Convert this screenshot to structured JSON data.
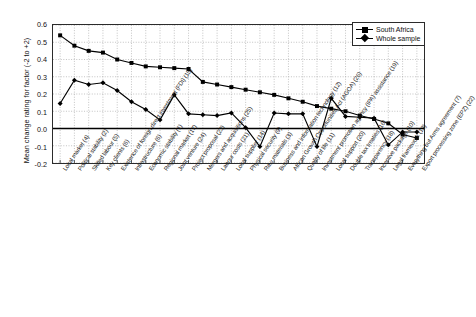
{
  "axes": {
    "ylabel": "Mean change rating for factor (-2 to +2)",
    "yticks": [
      "0.6",
      "0.5",
      "0.4",
      "0.3",
      "0.2",
      "0.1",
      "0.0",
      "-0.1",
      "-0.2"
    ],
    "ylim": [
      -0.2,
      0.6
    ],
    "grid": "dotted"
  },
  "legend": {
    "position": "top-right",
    "items": [
      {
        "label": "South Africa",
        "marker": "square"
      },
      {
        "label": "Whole sample",
        "marker": "diamond"
      }
    ]
  },
  "chart_data": {
    "type": "line",
    "title": "",
    "xlabel": "",
    "ylabel": "Mean change rating for factor (-2 to +2)",
    "ylim": [
      -0.2,
      0.6
    ],
    "grid": true,
    "legend_position": "top-right",
    "categories": [
      "Local market (4)",
      "Political stability (2)",
      "Skilled labour (5)",
      "Key clients (6)",
      "Existence of foreign direct investment (FDI) (15)",
      "Infrastructure (6)",
      "Economic stability (1)",
      "Regional market (17)",
      "Joint venture (24)",
      "Project proposal (23)",
      "Mergers and acquisitions (25)",
      "Labour costs (21)",
      "Local supplier (14)",
      "Physical security (9)",
      "Raw materials (3)",
      "Business and information technology (12)",
      "African Growth Opportunities Act (AGOA) (26)",
      "Quality of life (11)",
      "Investment promotion agency (IPA) assistance (19)",
      "Local support (20)",
      "Double tax treaties (16)",
      "Transparency (18)",
      "Incentive package (10)",
      "Legal framework (13)",
      "Everything but Arms agreement (7)",
      "Export processing zone (EPZ) (22)"
    ],
    "series": [
      {
        "name": "South Africa",
        "marker": "square",
        "values": [
          0.54,
          0.48,
          0.45,
          0.44,
          0.4,
          0.38,
          0.36,
          0.355,
          0.35,
          0.345,
          0.27,
          0.255,
          0.24,
          0.225,
          0.21,
          0.195,
          0.175,
          0.155,
          0.13,
          0.115,
          0.1,
          0.075,
          0.055,
          0.03,
          -0.035,
          -0.055
        ]
      },
      {
        "name": "Whole sample",
        "marker": "diamond",
        "values": [
          0.145,
          0.28,
          0.255,
          0.265,
          0.22,
          0.155,
          0.11,
          0.05,
          0.195,
          0.085,
          0.08,
          0.075,
          0.09,
          0.005,
          -0.105,
          0.09,
          0.085,
          0.085,
          -0.105,
          0.175,
          0.07,
          0.065,
          0.06,
          -0.095,
          -0.02,
          -0.02
        ]
      }
    ]
  }
}
